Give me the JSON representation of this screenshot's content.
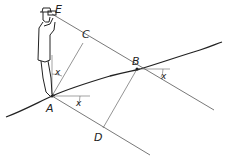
{
  "diagram": {
    "type": "surveying-slope-measurement",
    "points": {
      "E": "E",
      "C": "C",
      "B": "B",
      "A": "A",
      "D": "D"
    },
    "angle_labels": {
      "at_person": "x",
      "at_A": "x",
      "at_B": "x"
    },
    "colors": {
      "line": "#555555",
      "terrain": "#222222",
      "background": "#ffffff"
    }
  }
}
